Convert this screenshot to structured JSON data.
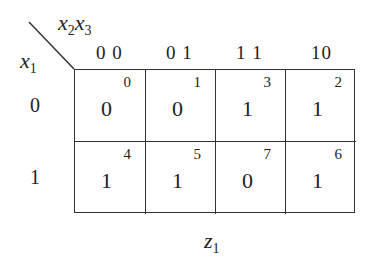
{
  "kmap": {
    "row_variable": {
      "name": "x",
      "sub": "1"
    },
    "col_variables": [
      {
        "name": "x",
        "sub": "2"
      },
      {
        "name": "x",
        "sub": "3"
      }
    ],
    "output": {
      "name": "z",
      "sub": "1"
    },
    "col_headers": [
      "0 0",
      "0 1",
      "1 1",
      "10"
    ],
    "row_headers": [
      "0",
      "1"
    ],
    "rows": [
      [
        {
          "value": "0",
          "index": "0"
        },
        {
          "value": "0",
          "index": "1"
        },
        {
          "value": "1",
          "index": "3"
        },
        {
          "value": "1",
          "index": "2"
        }
      ],
      [
        {
          "value": "1",
          "index": "4"
        },
        {
          "value": "1",
          "index": "5"
        },
        {
          "value": "0",
          "index": "7"
        },
        {
          "value": "1",
          "index": "6"
        }
      ]
    ]
  }
}
